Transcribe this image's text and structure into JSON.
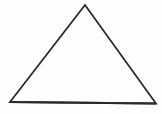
{
  "figure": {
    "name": "triangle",
    "title": "Triangle outline drawing",
    "canvas": {
      "width": 162,
      "height": 114,
      "background_color": "#fefefe"
    },
    "shape": {
      "kind": "triangle",
      "filled": false,
      "fill_color": "none",
      "stroke_color": "#2a2a2a",
      "stroke_width": 1.8,
      "base_stroke_width": 2.1,
      "vertices": [
        {
          "label": "apex",
          "x": 85,
          "y": 5
        },
        {
          "label": "bottom-right",
          "x": 156,
          "y": 103.5
        },
        {
          "label": "bottom-left",
          "x": 10,
          "y": 102
        }
      ],
      "points_attr": "85,5 156,103.5 10,102",
      "base_points_attr": "10,102 156,103.5"
    }
  },
  "chart_data": {
    "type": "diagram",
    "title": "Triangle outline drawing",
    "shapes": [
      {
        "type": "polygon",
        "name": "triangle",
        "vertices": [
          [
            85,
            5
          ],
          [
            156,
            103.5
          ],
          [
            10,
            102
          ]
        ],
        "closed": true,
        "fill": "none",
        "stroke": "#2a2a2a",
        "stroke_width": 1.8
      }
    ],
    "annotations": [],
    "xlabel": "",
    "ylabel": "",
    "xlim": [
      0,
      162
    ],
    "ylim": [
      0,
      114
    ],
    "grid": false,
    "legend": "none"
  }
}
